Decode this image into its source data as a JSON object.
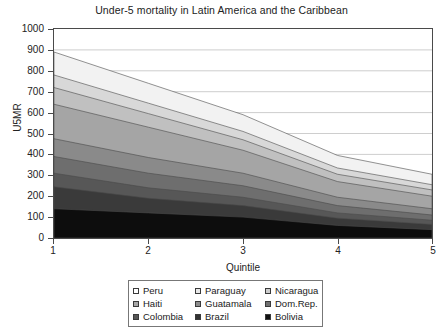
{
  "chart_data": {
    "type": "area",
    "title": "Under-5 mortality in Latin America and the Caribbean",
    "xlabel": "Quintile",
    "ylabel": "U5MR",
    "x": [
      1,
      2,
      3,
      4,
      5
    ],
    "xtick_labels": [
      "1",
      "2",
      "3",
      "4",
      "5"
    ],
    "ytick_labels": [
      "0",
      "100",
      "200",
      "300",
      "400",
      "500",
      "600",
      "700",
      "800",
      "900",
      "1000"
    ],
    "ylim": [
      0,
      1000
    ],
    "xlim": [
      1,
      5
    ],
    "grid": true,
    "stacked": true,
    "legend_position": "below",
    "series": [
      {
        "name": "Bolivia",
        "color": "#0d0d0d",
        "values": [
          140,
          120,
          100,
          60,
          40
        ]
      },
      {
        "name": "Brazil",
        "color": "#3a3a3a",
        "values": [
          105,
          70,
          55,
          35,
          25
        ]
      },
      {
        "name": "Colombia",
        "color": "#575757",
        "values": [
          65,
          50,
          40,
          25,
          20
        ]
      },
      {
        "name": "Dom.Rep.",
        "color": "#6e6e6e",
        "values": [
          80,
          70,
          55,
          35,
          25
        ]
      },
      {
        "name": "Guatamala",
        "color": "#8a8a8a",
        "values": [
          85,
          75,
          60,
          40,
          30
        ]
      },
      {
        "name": "Haiti",
        "color": "#a5a5a5",
        "values": [
          165,
          145,
          110,
          75,
          60
        ]
      },
      {
        "name": "Nicaragua",
        "color": "#c0c0c0",
        "values": [
          80,
          65,
          50,
          35,
          30
        ]
      },
      {
        "name": "Paraguay",
        "color": "#d8d8d8",
        "values": [
          60,
          50,
          40,
          30,
          25
        ]
      },
      {
        "name": "Peru",
        "color": "#f2f2f2",
        "values": [
          110,
          95,
          80,
          60,
          50
        ]
      }
    ],
    "stack_tops": {
      "Bolivia": [
        140,
        120,
        100,
        60,
        40
      ],
      "Brazil": [
        245,
        190,
        155,
        95,
        65
      ],
      "Colombia": [
        310,
        240,
        195,
        120,
        85
      ],
      "Dom.Rep.": [
        390,
        310,
        250,
        155,
        110
      ],
      "Guatamala": [
        475,
        385,
        310,
        195,
        140
      ],
      "Haiti": [
        640,
        530,
        420,
        270,
        200
      ],
      "Nicaragua": [
        720,
        595,
        470,
        305,
        230
      ],
      "Paraguay": [
        780,
        645,
        510,
        335,
        255
      ],
      "Peru": [
        875,
        740,
        585,
        395,
        315
      ]
    }
  },
  "legend": {
    "items": [
      {
        "label": "Peru",
        "swatch": "#ffffff"
      },
      {
        "label": "Paraguay",
        "swatch": "#e8e8e8"
      },
      {
        "label": "Nicaragua",
        "swatch": "#cdcdcd"
      },
      {
        "label": "Haiti",
        "swatch": "#a8a8a8"
      },
      {
        "label": "Guatamala",
        "swatch": "#8c8c8c"
      },
      {
        "label": "Dom.Rep.",
        "swatch": "#707070"
      },
      {
        "label": "Colombia",
        "swatch": "#565656"
      },
      {
        "label": "Brazil",
        "swatch": "#333333"
      },
      {
        "label": "Bolivia",
        "swatch": "#111111"
      }
    ]
  }
}
